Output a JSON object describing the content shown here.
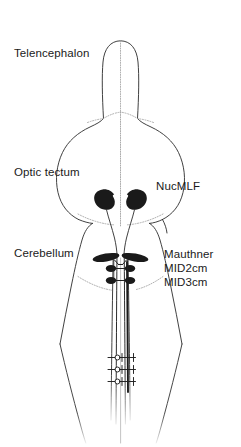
{
  "figure": {
    "width": 241,
    "height": 447,
    "background_color": "#ffffff"
  },
  "colors": {
    "outline": "#2b2b2b",
    "boundary_dotted": "#9a9a9a",
    "midline_dotted": "#a8a8a8",
    "cell_fill": "#1a1a1a",
    "axon": "#1f1f1f",
    "text": "#1a1a1a"
  },
  "labels": {
    "telencephalon": "Telencephalon",
    "optic_tectum": "Optic tectum",
    "cerebellum": "Cerebellum",
    "nucmlf": "NucMLF",
    "mauthner": "Mauthner",
    "mid2cm": "MID2cm",
    "mid3cm": "MID3cm"
  },
  "regions": [
    {
      "name": "telencephalon",
      "label": "Telencephalon",
      "label_side": "left"
    },
    {
      "name": "optic-tectum",
      "label": "Optic tectum",
      "label_side": "left"
    },
    {
      "name": "cerebellum",
      "label": "Cerebellum",
      "label_side": "left"
    }
  ],
  "cell_groups": [
    {
      "name": "nucmlf",
      "label": "NucMLF",
      "label_side": "right",
      "shape": "kidney-blob",
      "count": 2,
      "fill": "#1a1a1a",
      "has_axon_tail": true
    },
    {
      "name": "mauthner",
      "label": "Mauthner",
      "label_side": "right",
      "shape": "elongated-ellipse",
      "count": 2,
      "fill": "#1a1a1a",
      "has_axon_tail": true
    },
    {
      "name": "mid2cm",
      "label": "MID2cm",
      "label_side": "right",
      "shape": "small-ellipse",
      "count": 2,
      "fill": "#1a1a1a",
      "has_axon_tail": true
    },
    {
      "name": "mid3cm",
      "label": "MID3cm",
      "label_side": "right",
      "shape": "small-ellipse",
      "count": 2,
      "fill": "#1a1a1a",
      "has_axon_tail": true
    }
  ],
  "electrodes": {
    "name": "spinal-recording-electrodes",
    "count": 3,
    "glyph": "circle-with-shaft-and-crossbar"
  },
  "icons": {
    "nucmlf_cell": "neuron-soma-icon",
    "mauthner_cell": "neuron-soma-icon",
    "mid_cell": "neuron-soma-icon",
    "electrode": "electrode-icon",
    "midline": "midline-dotted-icon"
  }
}
